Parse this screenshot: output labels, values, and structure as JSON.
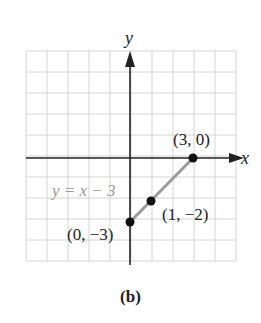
{
  "chart_data": {
    "type": "line",
    "title": "",
    "caption": "(b)",
    "xlabel": "x",
    "ylabel": "y",
    "xlim": [
      -5,
      5
    ],
    "ylim": [
      -5,
      5
    ],
    "grid": true,
    "grid_step": 1,
    "series": [
      {
        "name": "y = x − 3",
        "equation": "y = x − 3",
        "color": "#9a9a9a",
        "x": [
          0,
          1,
          3
        ],
        "y": [
          -3,
          -2,
          0
        ]
      }
    ],
    "points": [
      {
        "x": 3,
        "y": 0,
        "label": "(3, 0)"
      },
      {
        "x": 1,
        "y": -2,
        "label": "(1, −2)"
      },
      {
        "x": 0,
        "y": -3,
        "label": "(0, −3)"
      }
    ],
    "annotations": [
      {
        "text": "y = x − 3",
        "color": "#9a9a9a"
      }
    ]
  },
  "labels": {
    "x_axis": "x",
    "y_axis": "y",
    "equation": "y = x − 3",
    "p1": "(3, 0)",
    "p2": "(1, −2)",
    "p3": "(0, −3)",
    "caption": "(b)"
  },
  "colors": {
    "grid": "#d4d4d4",
    "axis": "#222222",
    "segment": "#9a9a9a",
    "point": "#111111",
    "equation_text": "#9a9a9a",
    "label_text": "#222222"
  }
}
